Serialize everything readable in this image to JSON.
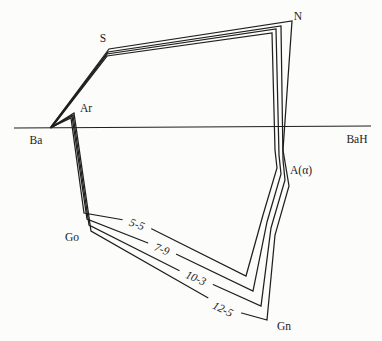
{
  "colors": {
    "background": "#fcfcfa",
    "line": "#1f1f1f",
    "text": "#1b1b1b"
  },
  "diagram": {
    "type": "superimposed-tracing-polygons",
    "baseline": {
      "x1": 14,
      "y1": 128,
      "x2": 371,
      "y2": 126
    },
    "landmarks": {
      "s": "S",
      "n": "N",
      "ar": "Ar",
      "ba": "Ba",
      "bah": "BaH",
      "a_alpha": "A(α)",
      "go": "Go",
      "gn": "Gn"
    },
    "tracings": [
      {
        "age": "5-5",
        "points": [
          [
            52,
            127
          ],
          [
            107,
            56
          ],
          [
            272,
            33
          ],
          [
            275,
            150
          ],
          [
            277,
            168
          ],
          [
            263,
            215
          ],
          [
            246,
            276
          ],
          [
            150,
            228
          ],
          [
            124,
            220
          ],
          [
            84,
            213
          ],
          [
            71,
            118
          ]
        ]
      },
      {
        "age": "7-9",
        "points": [
          [
            51,
            127
          ],
          [
            107,
            54
          ],
          [
            276,
            29
          ],
          [
            279,
            155
          ],
          [
            281,
            174
          ],
          [
            267,
            222
          ],
          [
            253,
            291
          ],
          [
            176,
            254
          ],
          [
            148,
            243
          ],
          [
            87,
            219
          ],
          [
            72,
            116
          ]
        ]
      },
      {
        "age": "10-3",
        "points": [
          [
            51,
            128
          ],
          [
            108,
            52
          ],
          [
            281,
            26
          ],
          [
            283,
            160
          ],
          [
            285,
            180
          ],
          [
            271,
            228
          ],
          [
            261,
            306
          ],
          [
            212,
            284
          ],
          [
            180,
            271
          ],
          [
            89,
            225
          ],
          [
            73,
            115
          ]
        ]
      },
      {
        "age": "12-5",
        "points": [
          [
            50,
            128
          ],
          [
            109,
            49
          ],
          [
            292,
            21
          ],
          [
            283,
            150
          ],
          [
            289,
            186
          ],
          [
            275,
            235
          ],
          [
            267,
            320
          ],
          [
            238,
            312
          ],
          [
            210,
            299
          ],
          [
            91,
            231
          ],
          [
            74,
            113
          ]
        ]
      }
    ]
  }
}
